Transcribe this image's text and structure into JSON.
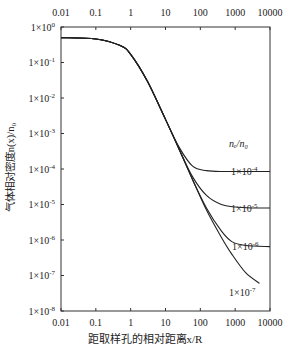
{
  "chart_data": {
    "type": "line",
    "title": "",
    "xlabel": "距取样孔的相对距离x/R",
    "ylabel": "气体相对密度n(x)/n0",
    "xscale": "log",
    "yscale": "log",
    "xlim": [
      0.01,
      10000
    ],
    "ylim": [
      1e-08,
      1
    ],
    "x_ticks": [
      "0.01",
      "0.1",
      "1",
      "10",
      "100",
      "1000",
      "10000"
    ],
    "y_ticks": [
      "1×10^0",
      "1×10^-1",
      "1×10^-2",
      "1×10^-3",
      "1×10^-4",
      "1×10^-5",
      "1×10^-6",
      "1×10^-7",
      "1×10^-8"
    ],
    "legend_title": "ne/n0",
    "grid": false,
    "series": [
      {
        "name": "1×10^-4",
        "x": [
          0.01,
          0.1,
          0.5,
          1,
          3,
          10,
          25,
          60,
          150,
          500,
          2000,
          10000
        ],
        "y": [
          0.5,
          0.46,
          0.3,
          0.17,
          0.03,
          0.0025,
          0.0004,
          0.00012,
          9e-05,
          8.5e-05,
          8.5e-05,
          8.5e-05
        ]
      },
      {
        "name": "1×10^-5",
        "x": [
          0.01,
          0.1,
          0.5,
          1,
          3,
          10,
          25,
          60,
          150,
          400,
          1000,
          3000,
          10000
        ],
        "y": [
          0.5,
          0.46,
          0.3,
          0.17,
          0.03,
          0.0025,
          0.00035,
          6e-05,
          1.8e-05,
          1e-05,
          8.5e-06,
          8e-06,
          8e-06
        ]
      },
      {
        "name": "1×10^-6",
        "x": [
          0.01,
          0.1,
          0.5,
          1,
          3,
          10,
          25,
          60,
          150,
          400,
          800,
          2000,
          10000
        ],
        "y": [
          0.5,
          0.46,
          0.3,
          0.17,
          0.03,
          0.0025,
          0.00035,
          5e-05,
          8e-06,
          1.8e-06,
          9e-07,
          7e-07,
          6.5e-07
        ]
      },
      {
        "name": "1×10^-7",
        "x": [
          0.01,
          0.1,
          0.5,
          1,
          3,
          10,
          25,
          60,
          150,
          400,
          800,
          2000,
          5000
        ],
        "y": [
          0.5,
          0.46,
          0.3,
          0.17,
          0.03,
          0.0025,
          0.00035,
          5e-05,
          7e-06,
          1.2e-06,
          4e-07,
          1.2e-07,
          6e-08
        ]
      }
    ],
    "annotations": [
      {
        "text": "1×10^-4",
        "near_series": "1×10^-4"
      },
      {
        "text": "1×10^-5",
        "near_series": "1×10^-5"
      },
      {
        "text": "1×10^-6",
        "near_series": "1×10^-6"
      },
      {
        "text": "1×10^-7",
        "near_series": "1×10^-7"
      }
    ]
  },
  "labels": {
    "xlabel": "距取样孔的相对距离x/R",
    "ylabel": "气体相对密度n(x)/n₀",
    "legend_title": "nₑ/n₀",
    "x_ticks": [
      "0.01",
      "0.1",
      "1",
      "10",
      "100",
      "1000",
      "10000"
    ],
    "y_tick_base": "1×10",
    "y_tick_exps": [
      "0",
      "-1",
      "-2",
      "-3",
      "-4",
      "-5",
      "-6",
      "-7",
      "-8"
    ],
    "curve_labels": [
      "1×10",
      "1×10",
      "1×10",
      "1×10"
    ],
    "curve_label_exps": [
      "-4",
      "-5",
      "-6",
      "-7"
    ]
  }
}
